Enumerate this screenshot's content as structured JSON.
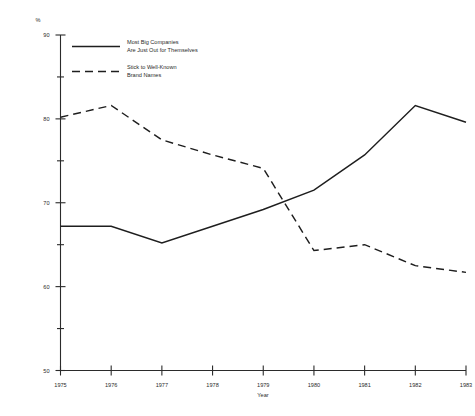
{
  "chart_data": {
    "type": "line",
    "title": "",
    "xlabel": "Year",
    "ylabel": "%",
    "unit_label": "%",
    "categories": [
      "1975",
      "1976",
      "1977",
      "1978",
      "1979",
      "1980",
      "1981",
      "1982",
      "1983"
    ],
    "x": [
      1975,
      1976,
      1977,
      1978,
      1979,
      1980,
      1981,
      1982,
      1983
    ],
    "xlim": [
      1975,
      1983
    ],
    "ylim": [
      50,
      90
    ],
    "y_ticks_major": [
      50,
      60,
      70,
      80,
      90
    ],
    "y_ticks_minor": [
      55,
      65,
      75,
      85
    ],
    "grid": false,
    "legend_position": "top-left-inside",
    "series": [
      {
        "name": "Most Big Companies Are Just Out for Themselves",
        "style": "solid",
        "color": "#1e1e1e",
        "values": [
          67.2,
          67.2,
          65.2,
          67.2,
          69.2,
          71.5,
          75.7,
          81.6,
          79.6
        ]
      },
      {
        "name": "Stick to Well-Known Brand Names",
        "style": "dashed",
        "color": "#1e1e1e",
        "values": [
          80.2,
          81.6,
          77.5,
          75.7,
          74.1,
          64.3,
          65.0,
          62.5,
          61.7
        ]
      }
    ]
  },
  "legend": {
    "entries": [
      {
        "style": "solid",
        "line1": "Most Big Companies",
        "line2": "Are Just Out for Themselves"
      },
      {
        "style": "dashed",
        "line1": "Stick to Well-Known",
        "line2": "Brand Names"
      }
    ]
  },
  "axes": {
    "y_unit": "%",
    "y_tick_labels": [
      "90",
      "80",
      "70",
      "60",
      "50"
    ],
    "x_tick_labels": [
      "1975",
      "1976",
      "1977",
      "1978",
      "1979",
      "1980",
      "1981",
      "1982",
      "1983"
    ],
    "x_title": "Year"
  },
  "colors": {
    "background": "#ffffff",
    "ink": "#1e1e1e",
    "axis": "#2b2b2b"
  }
}
